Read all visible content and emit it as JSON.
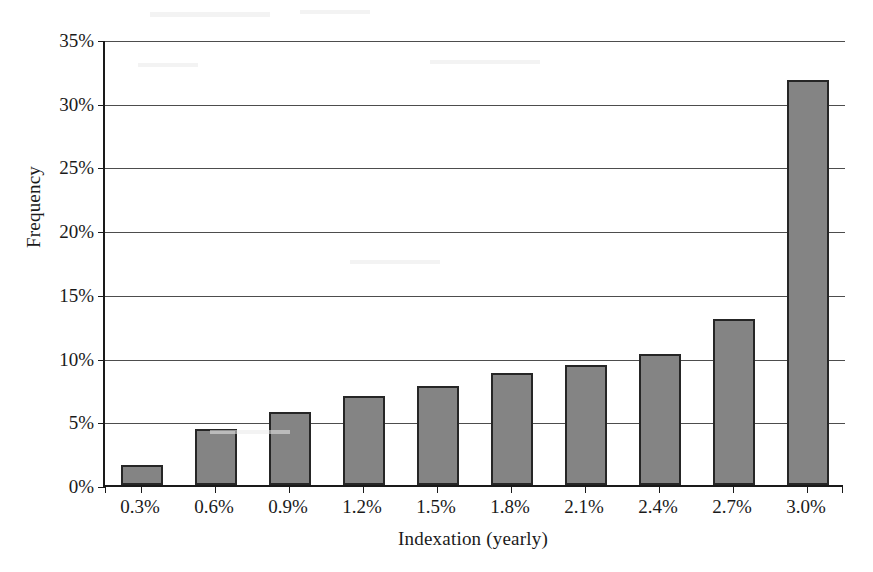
{
  "chart_data": {
    "type": "bar",
    "title": "",
    "xlabel": "Indexation (yearly)",
    "ylabel": "Frequency",
    "categories": [
      "0.3%",
      "0.6%",
      "0.9%",
      "1.2%",
      "1.5%",
      "1.8%",
      "2.1%",
      "2.4%",
      "2.7%",
      "3.0%"
    ],
    "values": [
      1.6,
      4.4,
      5.7,
      7.0,
      7.8,
      8.8,
      9.4,
      10.3,
      13.0,
      31.8
    ],
    "value_labels": [
      "1.6%",
      "4.4%",
      "5.7%",
      "7.0%",
      "7.8%",
      "8.8%",
      "9.4%",
      "10.3%",
      "13.0%",
      "31.8%"
    ],
    "ylim": [
      0,
      35
    ],
    "ytick_values": [
      0,
      5,
      10,
      15,
      20,
      25,
      30,
      35
    ],
    "ytick_labels": [
      "0%",
      "5%",
      "10%",
      "15%",
      "20%",
      "25%",
      "30%",
      "35%"
    ],
    "grid": "horizontal",
    "legend": "none",
    "bar_fill_color": "#848484",
    "bar_border_color": "#262626",
    "axis_color": "#1a1a1a",
    "gridline_color": "#4d4d4d",
    "background_color": "#ffffff"
  },
  "axes": {
    "y_title": "Frequency",
    "x_title": "Indexation (yearly)"
  }
}
